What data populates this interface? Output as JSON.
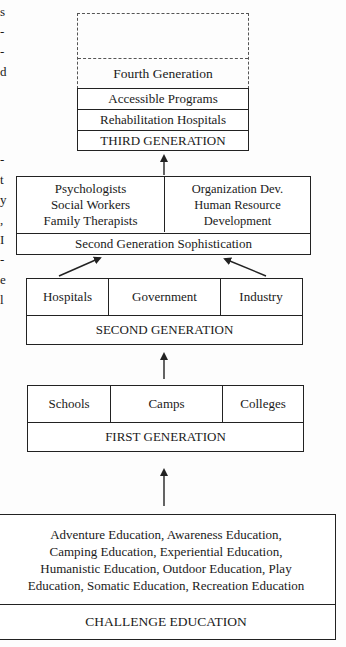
{
  "left_margin_fragments": [
    "s",
    "-",
    "-",
    "d",
    "-",
    "t",
    "y",
    ",",
    "I",
    "-",
    "e",
    "l"
  ],
  "fourth_generation": {
    "placeholder_label": "",
    "title": "Fourth Generation"
  },
  "third_generation": {
    "items": [
      "Accessible Programs",
      "Rehabilitation Hospitals"
    ],
    "title": "THIRD GENERATION"
  },
  "second_generation_sophistication": {
    "left_lines": [
      "Psychologists",
      "Social Workers",
      "Family Therapists"
    ],
    "right_lines": [
      "Organization Dev.",
      "Human Resource",
      "Development"
    ],
    "title": "Second Generation Sophistication"
  },
  "second_generation": {
    "items": [
      "Hospitals",
      "Government",
      "Industry"
    ],
    "title": "SECOND GENERATION"
  },
  "first_generation": {
    "items": [
      "Schools",
      "Camps",
      "Colleges"
    ],
    "title": "FIRST GENERATION"
  },
  "challenge_education": {
    "lines": [
      "Adventure Education, Awareness Education,",
      "Camping Education, Experiential Education,",
      "Humanistic Education, Outdoor Education, Play",
      "Education, Somatic Education, Recreation Education"
    ],
    "title": "CHALLENGE EDUCATION"
  }
}
